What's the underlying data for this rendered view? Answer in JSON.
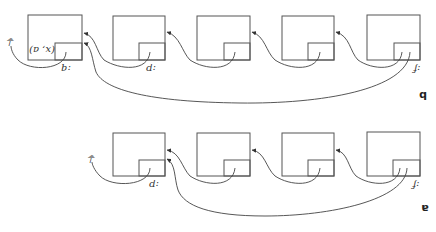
{
  "figure": {
    "orientation": "rotated-180",
    "top_cut_text": "",
    "panels": [
      {
        "id": "b",
        "label": "b",
        "node_count": 5,
        "nodes": [
          {
            "index": 1,
            "label": ":q",
            "inner_text": "(x, a)",
            "terminates_to": "ground"
          },
          {
            "index": 2,
            "label": ":p"
          },
          {
            "index": 3,
            "label": ""
          },
          {
            "index": 4,
            "label": ""
          },
          {
            "index": 5,
            "label": ":f"
          }
        ],
        "edges": [
          {
            "from": 2,
            "to": 1
          },
          {
            "from": 3,
            "to": 2
          },
          {
            "from": 4,
            "to": 3
          },
          {
            "from": 5,
            "to": 4
          },
          {
            "from": 5,
            "to": 1,
            "type": "long-jump"
          }
        ]
      },
      {
        "id": "a",
        "label": "a",
        "node_count": 4,
        "nodes": [
          {
            "index": 1,
            "label": ":p",
            "terminates_to": "ground"
          },
          {
            "index": 2,
            "label": ""
          },
          {
            "index": 3,
            "label": ""
          },
          {
            "index": 4,
            "label": ":f"
          }
        ],
        "edges": [
          {
            "from": 2,
            "to": 1
          },
          {
            "from": 3,
            "to": 2
          },
          {
            "from": 4,
            "to": 3
          },
          {
            "from": 4,
            "to": 1,
            "type": "long-jump"
          }
        ]
      }
    ],
    "labels": {
      "panel_b": "b",
      "panel_a": "a",
      "q_label": ":q",
      "p_label": ":p",
      "f_label": ":f",
      "pair_text": "(x, a)",
      "ground_symbol": "⏚"
    }
  }
}
